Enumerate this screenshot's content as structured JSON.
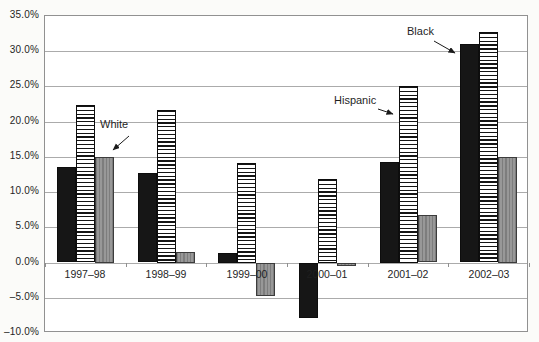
{
  "figure": {
    "background": "#fbfbf9",
    "plot_background": "#ffffff",
    "grid_color": "#ababab",
    "border_color": "#919191",
    "bar_colors": {
      "black_series": "#161616",
      "hispanic_series_stripes": "#141414",
      "white_series_gray": "#989898"
    }
  },
  "chart_data": {
    "type": "bar",
    "title": "",
    "xlabel": "",
    "ylabel": "",
    "categories": [
      "1997–98",
      "1998–99",
      "1999–00",
      "2000–01",
      "2001–02",
      "2002–03"
    ],
    "series": [
      {
        "name": "Black",
        "pattern": "solid-black",
        "values": [
          13.5,
          12.7,
          1.4,
          -7.8,
          14.3,
          31.0
        ]
      },
      {
        "name": "Hispanic",
        "pattern": "horizontal-stripes",
        "values": [
          22.3,
          21.7,
          14.2,
          11.9,
          25.1,
          32.7
        ]
      },
      {
        "name": "White",
        "pattern": "gray-vertical-stripes",
        "values": [
          15.0,
          1.5,
          -4.7,
          -0.4,
          6.7,
          15.0
        ]
      }
    ],
    "ylim": [
      -10,
      35
    ],
    "ytick_values": [
      35,
      30,
      25,
      20,
      15,
      10,
      5,
      0,
      -5,
      -10
    ],
    "ytick_labels": [
      "35.0%",
      "30.0%",
      "25.0%",
      "20.0%",
      "15.0%",
      "10.0%",
      "5.0%",
      "0.0%",
      "–5.0%",
      "–10.0%"
    ],
    "grid": true,
    "legend_position": "inline-annotations",
    "annotations": [
      {
        "label": "White",
        "series": "White",
        "target_group": "1997–98"
      },
      {
        "label": "Hispanic",
        "series": "Hispanic",
        "target_group": "2001–02"
      },
      {
        "label": "Black",
        "series": "Black",
        "target_group": "2002–03"
      }
    ]
  }
}
